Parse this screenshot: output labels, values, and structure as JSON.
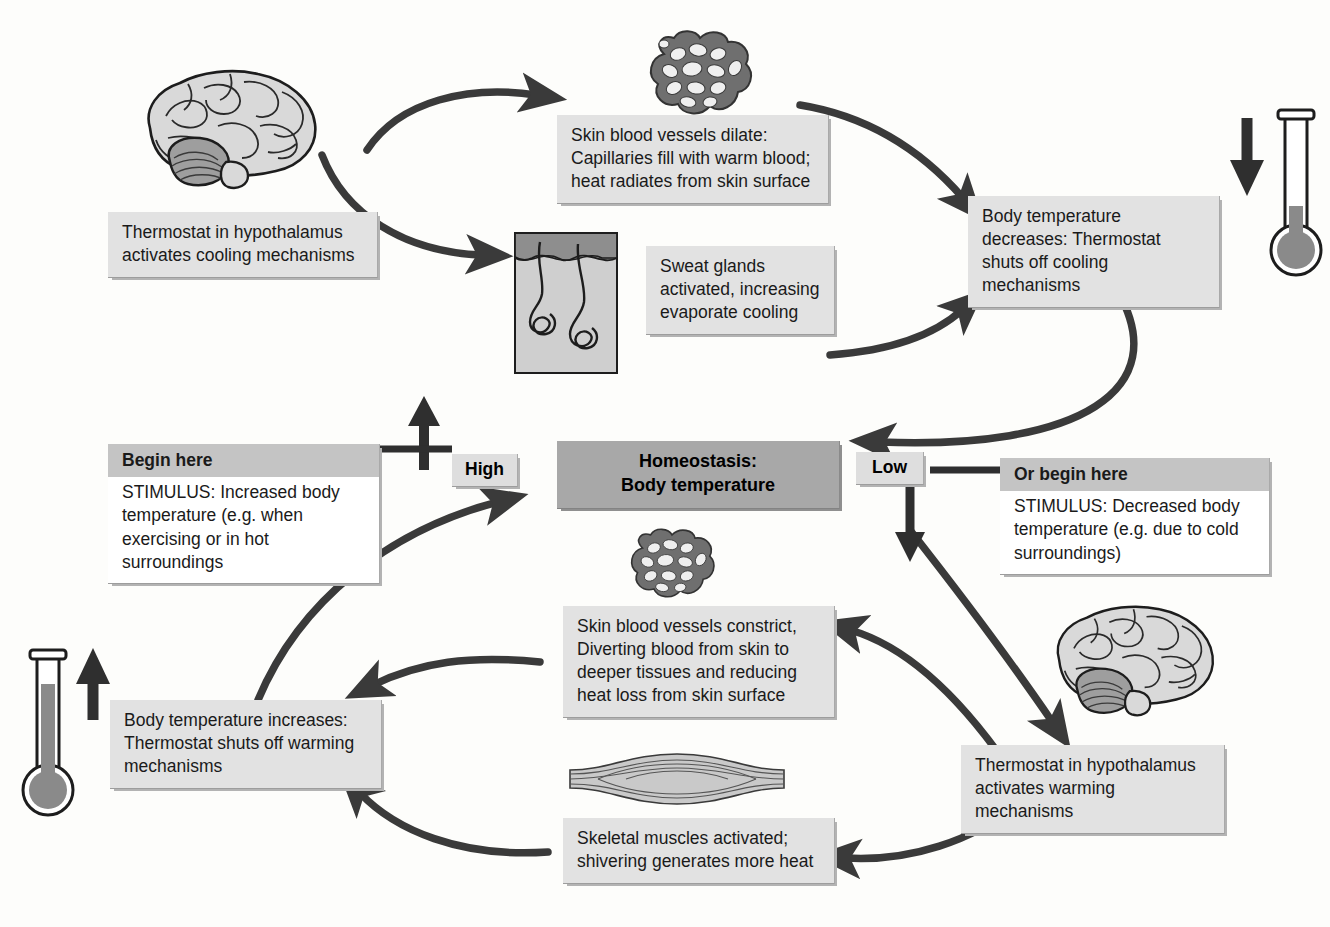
{
  "diagram": {
    "center": {
      "line1": "Homeostasis:",
      "line2": "Body temperature"
    },
    "tags": {
      "high": "High",
      "low": "Low"
    },
    "stimulus_hot": {
      "header": "Begin here",
      "body": "STIMULUS: Increased body temperature (e.g. when exercising or in hot surroundings"
    },
    "stimulus_cold": {
      "header": "Or begin here",
      "body": "STIMULUS: Decreased body temperature (e.g. due to cold surroundings)"
    },
    "boxes": {
      "hypothalamus_cooling": "Thermostat in hypothalamus activates cooling mechanisms",
      "vessels_dilate": "Skin blood vessels dilate: Capillaries fill with warm blood; heat radiates from skin surface",
      "sweat_glands": "Sweat glands activated, increasing evaporate cooling",
      "temp_decreases": "Body temperature decreases: Thermostat shuts off cooling mechanisms",
      "hypothalamus_warming": "Thermostat in hypothalamus activates warming mechanisms",
      "vessels_constrict": "Skin blood vessels constrict, Diverting blood from skin to deeper tissues and reducing heat loss from skin surface",
      "skeletal_muscles": "Skeletal muscles activated; shivering generates more heat",
      "temp_increases": "Body temperature increases: Thermostat shuts off warming mechanisms"
    },
    "illustrations": {
      "brain_top": "brain-illustration",
      "brain_bottom": "brain-illustration",
      "capillary_top": "capillary-network-illustration",
      "capillary_bottom": "capillary-network-illustration",
      "sweat_gland": "sweat-gland-skin-illustration",
      "muscle": "skeletal-muscle-illustration",
      "thermometer_down": "thermometer-falling-illustration",
      "thermometer_up": "thermometer-rising-illustration"
    },
    "colors": {
      "box_fill": "#e2e2e2",
      "header_fill": "#c4c4c4",
      "center_fill": "#a8a8a8",
      "arrow": "#3a3a3a",
      "page_background": "#fdfdfb"
    }
  }
}
